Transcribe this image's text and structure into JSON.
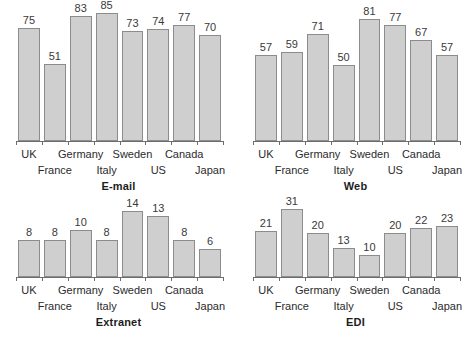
{
  "figure": {
    "background": "#ffffff",
    "bar_fill": "#cfcfcf",
    "bar_stroke": "#8c8c8c",
    "axis_color": "#6d6d6d",
    "text_color": "#2b2b2b"
  },
  "chart_data": [
    {
      "type": "bar",
      "title": "E-mail",
      "xlabel": "",
      "ylabel": "",
      "ylim": [
        0,
        85
      ],
      "grid": false,
      "legend": "none",
      "categories": [
        "UK",
        "France",
        "Germany",
        "Italy",
        "Sweden",
        "US",
        "Canada",
        "Japan"
      ],
      "values": [
        75,
        51,
        83,
        85,
        73,
        74,
        77,
        70
      ]
    },
    {
      "type": "bar",
      "title": "Web",
      "xlabel": "",
      "ylabel": "",
      "ylim": [
        0,
        85
      ],
      "grid": false,
      "legend": "none",
      "categories": [
        "UK",
        "France",
        "Germany",
        "Italy",
        "Sweden",
        "US",
        "Canada",
        "Japan"
      ],
      "values": [
        57,
        59,
        71,
        50,
        81,
        77,
        67,
        57
      ]
    },
    {
      "type": "bar",
      "title": "Extranet",
      "xlabel": "",
      "ylabel": "",
      "ylim": [
        0,
        85
      ],
      "grid": false,
      "legend": "none",
      "categories": [
        "UK",
        "France",
        "Germany",
        "Italy",
        "Sweden",
        "US",
        "Canada",
        "Japan"
      ],
      "values": [
        8,
        8,
        10,
        8,
        14,
        13,
        8,
        6
      ]
    },
    {
      "type": "bar",
      "title": "EDI",
      "xlabel": "",
      "ylabel": "",
      "ylim": [
        0,
        85
      ],
      "grid": false,
      "legend": "none",
      "categories": [
        "UK",
        "France",
        "Germany",
        "Italy",
        "Sweden",
        "US",
        "Canada",
        "Japan"
      ],
      "values": [
        21,
        31,
        20,
        13,
        10,
        20,
        22,
        23
      ]
    }
  ]
}
